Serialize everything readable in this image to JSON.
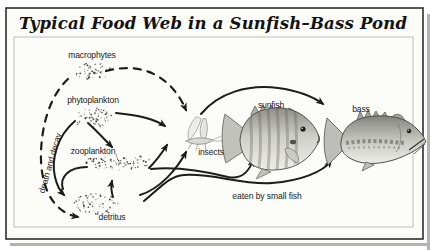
{
  "title": "Typical Food Web in a Sunfish–Bass Pond",
  "nodes": {
    "macrophytes": "macrophytes",
    "phytoplankton": "phytoplankton",
    "zooplankton": "zooplankton",
    "detritus": "detritus",
    "insects": "insects",
    "sunfish": "sunfish",
    "bass": "bass"
  },
  "annotations": {
    "death_and_decay": "death and decay",
    "eaten_by_small_fish": "eaten by small fish"
  },
  "edges": [
    {
      "from": "macrophytes",
      "to": "insects",
      "style": "dashed"
    },
    {
      "from": "macrophytes",
      "to": "detritus",
      "style": "dashed",
      "label": "death and decay"
    },
    {
      "from": "phytoplankton",
      "to": "insects",
      "style": "solid"
    },
    {
      "from": "phytoplankton",
      "to": "zooplankton",
      "style": "solid"
    },
    {
      "from": "phytoplankton",
      "to": "detritus",
      "style": "solid"
    },
    {
      "from": "zooplankton",
      "to": "detritus",
      "style": "solid"
    },
    {
      "from": "detritus",
      "to": "zooplankton",
      "style": "solid"
    },
    {
      "from": "zooplankton",
      "to": "insects",
      "style": "solid"
    },
    {
      "from": "detritus",
      "to": "insects",
      "style": "solid"
    },
    {
      "from": "zooplankton",
      "to": "sunfish",
      "style": "solid"
    },
    {
      "from": "detritus",
      "to": "bass",
      "style": "solid",
      "label": "eaten by small fish"
    },
    {
      "from": "insects",
      "to": "bass",
      "style": "solid"
    }
  ],
  "colors": {
    "ink": "#1c1c1a",
    "card_bg": "#fcfcf9",
    "outer_border": "#2e2e2a",
    "inner_border": "#bcbcb8",
    "shadow": "#b4b4ae"
  }
}
